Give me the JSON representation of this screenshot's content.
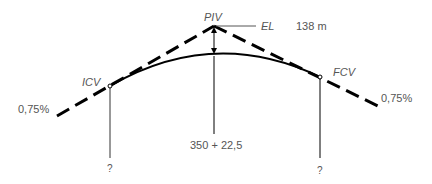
{
  "diagram": {
    "type": "vertical-curve-crest",
    "labels": {
      "piv": "PIV",
      "el": "EL",
      "elevation": "138 m",
      "icv": "ICV",
      "fcv": "FCV",
      "grade_left": "0,75%",
      "grade_right": "0,75%",
      "station_piv": "350 + 22,5",
      "station_icv": "?",
      "station_fcv": "?"
    },
    "colors": {
      "line": "#000000",
      "text": "#555555",
      "background": "#ffffff"
    }
  }
}
